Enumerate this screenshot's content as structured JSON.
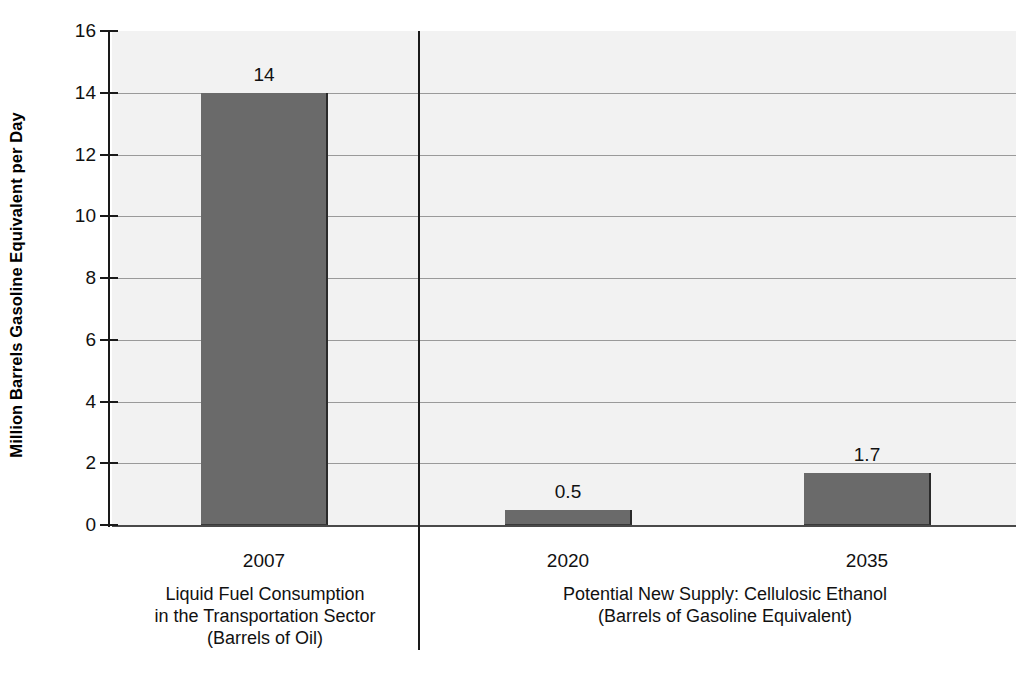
{
  "chart_data": {
    "type": "bar",
    "title": "",
    "subtitle": "",
    "xlabel": "",
    "ylabel": "Million Barrels Gasoline Equivalent per Day",
    "ylim": [
      0,
      16
    ],
    "ytick_labels": [
      "16",
      "14",
      "12",
      "10",
      "8",
      "6",
      "4",
      "2",
      "0"
    ],
    "ytick_values": [
      16,
      14,
      12,
      10,
      8,
      6,
      4,
      2,
      0
    ],
    "grid": true,
    "grid_axis": "y",
    "legend": false,
    "categories": [
      "2007",
      "2020",
      "2035"
    ],
    "values": [
      14,
      0.5,
      1.7
    ],
    "value_labels": [
      "14",
      "0.5",
      "1.7"
    ],
    "bar_color": "#6a6a6a",
    "plot_background": "#f2f2f2",
    "groups": [
      {
        "name": "liquid-fuel-consumption",
        "lines": [
          "Liquid Fuel Consumption",
          "in the Transportation Sector",
          "(Barrels of Oil)"
        ],
        "categories": [
          "2007"
        ]
      },
      {
        "name": "potential-new-supply",
        "lines": [
          "Potential New Supply: Cellulosic Ethanol",
          "(Barrels of Gasoline Equivalent)"
        ],
        "categories": [
          "2020",
          "2035"
        ]
      }
    ],
    "bars": [
      {
        "category": "2007",
        "value": 14,
        "label": "14"
      },
      {
        "category": "2020",
        "value": 0.5,
        "label": "0.5"
      },
      {
        "category": "2035",
        "value": 1.7,
        "label": "1.7"
      }
    ]
  },
  "axis": {
    "y_title": "Million Barrels Gasoline Equivalent per Day",
    "ticks": [
      {
        "label": "16"
      },
      {
        "label": "14"
      },
      {
        "label": "12"
      },
      {
        "label": "10"
      },
      {
        "label": "8"
      },
      {
        "label": "6"
      },
      {
        "label": "4"
      },
      {
        "label": "2"
      },
      {
        "label": "0"
      }
    ]
  },
  "bars": [
    {
      "year": "2007",
      "value_label": "14"
    },
    {
      "year": "2020",
      "value_label": "0.5"
    },
    {
      "year": "2035",
      "value_label": "1.7"
    }
  ],
  "groups": {
    "left": {
      "line1": "Liquid Fuel Consumption",
      "line2": "in the Transportation Sector",
      "line3": "(Barrels of Oil)"
    },
    "right": {
      "line1": "Potential New Supply: Cellulosic Ethanol",
      "line2": "(Barrels of Gasoline Equivalent)"
    }
  }
}
